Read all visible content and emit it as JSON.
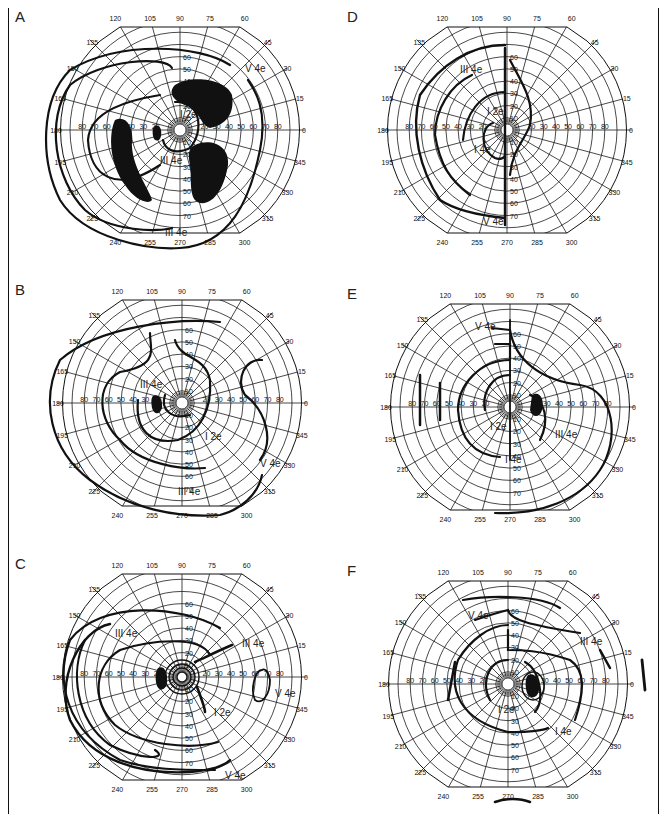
{
  "figure": {
    "panels": [
      {
        "letter": "A",
        "cx": 180,
        "cy": 130,
        "isopters": [
          {
            "label": "V 4e",
            "label_pos": [
              245,
              72
            ]
          },
          {
            "label": "III 4e",
            "label_pos": [
              160,
              164
            ]
          },
          {
            "label": "III 4e",
            "label_pos": [
              165,
              236
            ]
          },
          {
            "label": "I 2e",
            "label_pos": [
              180,
              118
            ]
          }
        ],
        "scotomas": [
          "large dense annular scotoma (three blobs)",
          "blind spot at 15° temporal"
        ]
      },
      {
        "letter": "D",
        "cx": 507,
        "cy": 130,
        "isopters": [
          {
            "label": "III 4e",
            "label_pos": [
              460,
              73
            ]
          },
          {
            "label": "I 2e",
            "label_pos": [
              487,
              115
            ]
          },
          {
            "label": "I 4e",
            "label_pos": [
              474,
              153
            ]
          },
          {
            "label": "V 4e",
            "label_pos": [
              483,
              225
            ]
          }
        ],
        "scotomas": [
          "hemianopic defect right half"
        ]
      },
      {
        "letter": "B",
        "cx": 182,
        "cy": 403,
        "isopters": [
          {
            "label": "III 4e",
            "label_pos": [
              140,
              388
            ]
          },
          {
            "label": "I 2e",
            "label_pos": [
              205,
              440
            ]
          },
          {
            "label": "V 4e",
            "label_pos": [
              260,
              467
            ]
          },
          {
            "label": "III 4e",
            "label_pos": [
              178,
              495
            ]
          }
        ],
        "scotomas": [
          "blind spot"
        ]
      },
      {
        "letter": "E",
        "cx": 510,
        "cy": 407,
        "isopters": [
          {
            "label": "V 4e",
            "label_pos": [
              475,
              330
            ]
          },
          {
            "label": "I 2e",
            "label_pos": [
              490,
              430
            ]
          },
          {
            "label": "III 4e",
            "label_pos": [
              555,
              438
            ]
          },
          {
            "label": "I 4e",
            "label_pos": [
              505,
              463
            ]
          }
        ],
        "scotomas": [
          "blind spot"
        ]
      },
      {
        "letter": "C",
        "cx": 182,
        "cy": 677,
        "isopters": [
          {
            "label": "III 4e",
            "label_pos": [
              115,
              637
            ]
          },
          {
            "label": "III 4e",
            "label_pos": [
              242,
              647
            ]
          },
          {
            "label": "V 4e",
            "label_pos": [
              275,
              697
            ]
          },
          {
            "label": "I 2e",
            "label_pos": [
              214,
              716
            ]
          },
          {
            "label": "V 4e",
            "label_pos": [
              225,
              779
            ]
          }
        ],
        "scotomas": [
          "blind spot"
        ]
      },
      {
        "letter": "F",
        "cx": 508,
        "cy": 684,
        "isopters": [
          {
            "label": "V 4e",
            "label_pos": [
              468,
              619
            ]
          },
          {
            "label": "III 4e",
            "label_pos": [
              580,
              645
            ]
          },
          {
            "label": "I 2e",
            "label_pos": [
              498,
              713
            ]
          },
          {
            "label": "I 4e",
            "label_pos": [
              555,
              735
            ]
          }
        ],
        "scotomas": [
          "enlarged blind spot"
        ]
      }
    ],
    "angle_labels": [
      "0",
      "15",
      "30",
      "45",
      "60",
      "75",
      "90",
      "105",
      "120",
      "135",
      "150",
      "165",
      "180",
      "195",
      "210",
      "225",
      "240",
      "255",
      "270",
      "285",
      "300",
      "315",
      "330",
      "345"
    ],
    "radial_labels_horizontal": [
      "80",
      "70",
      "60",
      "50",
      "40",
      "30",
      "20"
    ],
    "radial_labels_vertical_up": [
      "10",
      "20",
      "30",
      "40",
      "50",
      "60"
    ],
    "radial_labels_vertical_down": [
      "10",
      "20",
      "30",
      "40",
      "50",
      "60",
      "70"
    ],
    "colors": {
      "ink": "#111111",
      "grid": "#1a1a1a",
      "paper": "#ffffff"
    }
  }
}
